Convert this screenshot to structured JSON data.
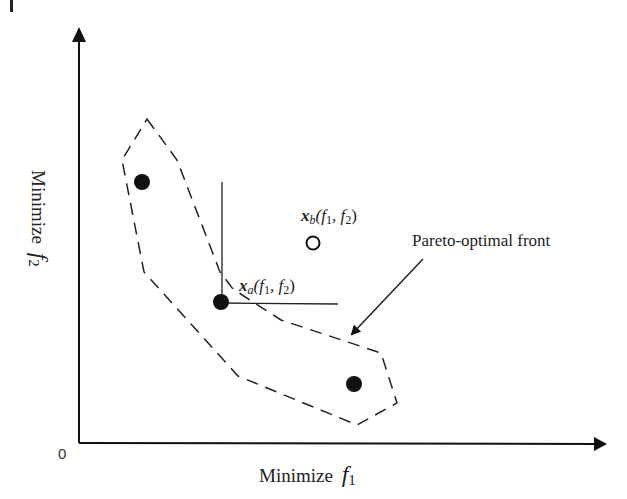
{
  "figure": {
    "type": "pareto-front-diagram",
    "x_axis": {
      "label": "Minimize",
      "symbol": "f",
      "subscript": "1"
    },
    "y_axis": {
      "label": "Minimize",
      "symbol": "f",
      "subscript": "2"
    },
    "origin_label": "0",
    "front_label": "Pareto-optimal front",
    "points": [
      {
        "id": "p1",
        "filled": true,
        "x": 142,
        "y": 182
      },
      {
        "id": "xa",
        "filled": true,
        "x": 221,
        "y": 302,
        "label_var": "x",
        "label_sub": "a",
        "label_args": "(f",
        "label_arg1_sub": "1",
        "label_sep": ", f",
        "label_arg2_sub": "2",
        "label_close": ")"
      },
      {
        "id": "p3",
        "filled": true,
        "x": 354,
        "y": 384
      },
      {
        "id": "xb",
        "filled": false,
        "x": 313,
        "y": 243,
        "label_var": "x",
        "label_sub": "b",
        "label_args": "(f",
        "label_arg1_sub": "1",
        "label_sep": ", f",
        "label_arg2_sub": "2",
        "label_close": ")"
      }
    ],
    "colors": {
      "ink": "#111111",
      "background": "#ffffff"
    }
  }
}
